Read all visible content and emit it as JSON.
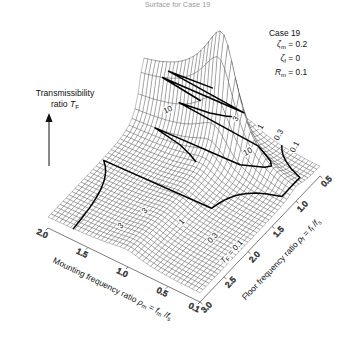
{
  "figure": {
    "title_caption": "Surface for Case 19",
    "vertical_axis": {
      "line1": "Transmissibility",
      "line2_prefix": "ratio ",
      "line2_symbol": "T",
      "line2_sub": "F"
    },
    "annotation": {
      "case": "Case 19",
      "rows": [
        {
          "symbol": "ζ",
          "sub": "m",
          "eq": "= 0.2"
        },
        {
          "symbol": "ζ",
          "sub": "f",
          "eq": "= 0"
        },
        {
          "symbol": "R",
          "sub": "m",
          "eq": "= 0.1"
        }
      ]
    },
    "left_axis": {
      "label_text": "Mounting frequency ratio ",
      "label_sym": "ρ",
      "label_sub": "m",
      "label_tail": " = ",
      "num": "f",
      "num_sub": "m",
      "den": "f",
      "den_sub": "s",
      "ticks": [
        "2.0",
        "1.5",
        "1.0",
        "0.5",
        "0.1"
      ],
      "tick_values": [
        2.0,
        1.5,
        1.0,
        0.5,
        0.1
      ]
    },
    "right_axis": {
      "label_text": "Floor frequency ratio ",
      "label_sym": "ρ",
      "label_sub": "f",
      "label_tail": " = ",
      "num": "f",
      "num_sub": "f",
      "den": "f",
      "den_sub": "s",
      "ticks": [
        "3.0",
        "2.5",
        "2.0",
        "1.5",
        "1.0",
        "0.5"
      ],
      "tick_values": [
        3.0,
        2.5,
        2.0,
        1.5,
        1.0,
        0.5
      ]
    },
    "contour_labels": [
      {
        "text": "T",
        "sub": "F",
        "eq": " = 0.1",
        "x": 232,
        "y": 252,
        "rot": -47
      },
      {
        "text": "0.3",
        "x": 213,
        "y": 238,
        "rot": -47
      },
      {
        "text": "1",
        "x": 182,
        "y": 222,
        "rot": -47
      },
      {
        "text": "3",
        "x": 145,
        "y": 211,
        "rot": -47
      },
      {
        "text": "3",
        "x": 121,
        "y": 226,
        "rot": -47
      },
      {
        "text": "10",
        "x": 168,
        "y": 110,
        "rot": -24
      },
      {
        "text": "3",
        "x": 236,
        "y": 119,
        "rot": -60
      },
      {
        "text": "1",
        "x": 261,
        "y": 127,
        "rot": -62
      },
      {
        "text": "0.3",
        "x": 279,
        "y": 135,
        "rot": -62
      },
      {
        "text": "0.1",
        "x": 295,
        "y": 147,
        "rot": -62
      },
      {
        "text": "10",
        "x": 248,
        "y": 152,
        "rot": -28
      }
    ]
  },
  "chart_data": {
    "type": "surface",
    "title": "Surface for Case 19",
    "zlabel": "Transmissibility ratio T_F",
    "xlabel": "Mounting frequency ratio ρ_m = f_m / f_s",
    "ylabel": "Floor frequency ratio ρ_f = f_f / f_s",
    "xlim": [
      0.1,
      2.0
    ],
    "ylim": [
      0.5,
      3.0
    ],
    "zlim": [
      0,
      30
    ],
    "z_scale": "linear",
    "parameters": {
      "zeta_m": 0.2,
      "zeta_f": 0.0,
      "R_m": 0.1,
      "case": 19
    },
    "contour_levels": [
      0.1,
      0.3,
      1,
      3,
      10
    ],
    "grid": true,
    "legend": "none",
    "mesh_nx": 41,
    "mesh_ny": 41
  }
}
